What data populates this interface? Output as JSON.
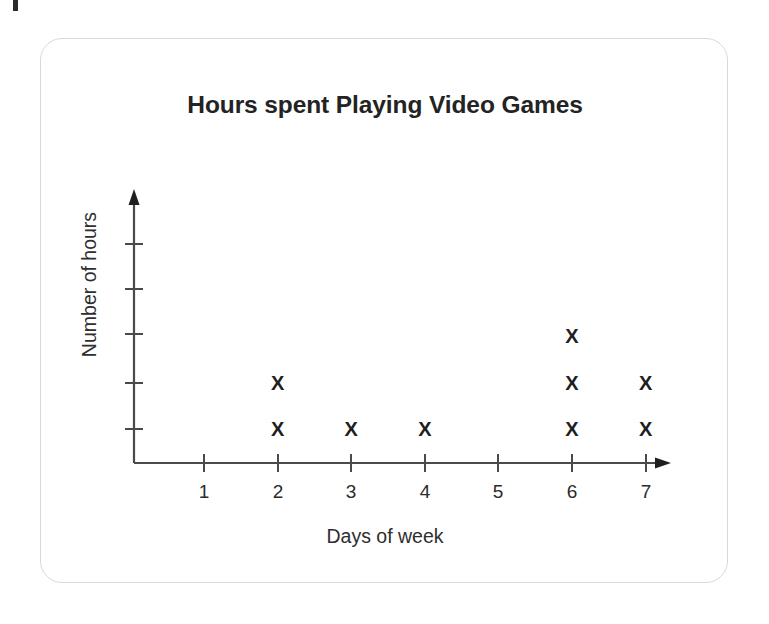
{
  "card": {
    "border_color": "#d9d9d9",
    "background": "#ffffff"
  },
  "chart_data": {
    "type": "scatter",
    "plot_style": "dot-plot",
    "title": "Hours spent Playing Video Games",
    "xlabel": "Days of week",
    "ylabel": "Number of hours",
    "categories": [
      "1",
      "2",
      "3",
      "4",
      "5",
      "6",
      "7"
    ],
    "x": [
      1,
      2,
      3,
      4,
      5,
      6,
      7
    ],
    "values": [
      0,
      2,
      1,
      1,
      0,
      3,
      2
    ],
    "xtick_labels": [
      "1",
      "2",
      "3",
      "4",
      "5",
      "6",
      "7"
    ],
    "ytick_labels": [
      "",
      "",
      "",
      "",
      ""
    ],
    "ytick_count": 5,
    "xlim": [
      0,
      7.6
    ],
    "ylim": [
      0,
      5
    ],
    "grid": false,
    "legend": false,
    "marker": "x",
    "marker_color": "#1f1f1f",
    "axis_color": "#4a4a4a",
    "points": [
      {
        "day": 2,
        "level": 1
      },
      {
        "day": 2,
        "level": 2
      },
      {
        "day": 3,
        "level": 1
      },
      {
        "day": 4,
        "level": 1
      },
      {
        "day": 6,
        "level": 1
      },
      {
        "day": 6,
        "level": 2
      },
      {
        "day": 6,
        "level": 3
      },
      {
        "day": 7,
        "level": 1
      },
      {
        "day": 7,
        "level": 2
      }
    ],
    "marker_glyph": "X",
    "annotations": []
  }
}
